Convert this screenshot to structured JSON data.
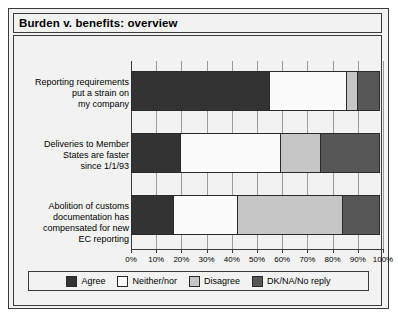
{
  "header": {
    "title": "Burden v. benefits: overview"
  },
  "chart_data": {
    "type": "bar",
    "orientation": "horizontal",
    "stacked": true,
    "stack_mode": "percent",
    "title": "Burden v. benefits: overview",
    "xlabel": "",
    "ylabel": "",
    "xlim": [
      0,
      100
    ],
    "grid": true,
    "legend_position": "bottom",
    "xtick_labels": [
      "0%",
      "10%",
      "20%",
      "30%",
      "40%",
      "50%",
      "60%",
      "70%",
      "80%",
      "90%",
      "100%"
    ],
    "xticks": [
      0,
      10,
      20,
      30,
      40,
      50,
      60,
      70,
      80,
      90,
      100
    ],
    "categories": [
      "Reporting requirements\nput a strain on\nmy company",
      "Deliveries to Member\nStates are faster\nsince 1/1/93",
      "Abolition of customs\ndocumentation has\ncompensated for new\nEC reporting"
    ],
    "series": [
      {
        "name": "Agree",
        "color": "#333333",
        "values": [
          55,
          20,
          17
        ]
      },
      {
        "name": "Neither/nor",
        "color": "#fbfbfb",
        "values": [
          31,
          40,
          26
        ]
      },
      {
        "name": "Disagree",
        "color": "#c6c6c6",
        "values": [
          5,
          16,
          42
        ]
      },
      {
        "name": "DK/NA/No reply",
        "color": "#575757",
        "values": [
          9,
          24,
          15
        ]
      }
    ]
  }
}
